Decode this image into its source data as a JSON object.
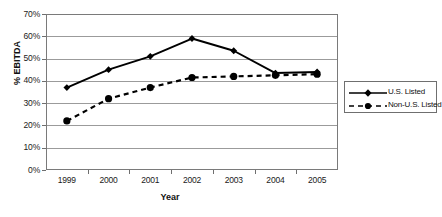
{
  "chart_data": {
    "type": "line",
    "title": "",
    "subtitle": "",
    "xlabel": "Year",
    "ylabel": "% EBITDA",
    "categories": [
      "1999",
      "2000",
      "2001",
      "2002",
      "2003",
      "2004",
      "2005"
    ],
    "x": [
      1999,
      2000,
      2001,
      2002,
      2003,
      2004,
      2005
    ],
    "series": [
      {
        "name": "U.S. Listed",
        "values": [
          37,
          45,
          51,
          59,
          53.5,
          43.5,
          44
        ],
        "marker": "diamond",
        "linestyle": "solid",
        "color": "#000000"
      },
      {
        "name": "Non-U.S. Listed",
        "values": [
          22,
          32,
          37,
          41.5,
          42,
          42.5,
          43
        ],
        "marker": "circle",
        "linestyle": "dashed",
        "color": "#000000"
      }
    ],
    "ylim": [
      0,
      70
    ],
    "ytick_values": [
      0,
      10,
      20,
      30,
      40,
      50,
      60,
      70
    ],
    "ytick_labels": [
      "0%",
      "10%",
      "20%",
      "30%",
      "40%",
      "50%",
      "60%",
      "70%"
    ],
    "grid": true,
    "grid_axis": "y",
    "legend_position": "right",
    "legend_entries": [
      "U.S. Listed",
      "Non-U.S. Listed"
    ],
    "annotations": []
  },
  "colors": {
    "plot_background": "#ffffff",
    "frame": "#7a7a7a",
    "gridline": "#9b9b9b",
    "series_line": "#000000",
    "text": "#111111"
  }
}
